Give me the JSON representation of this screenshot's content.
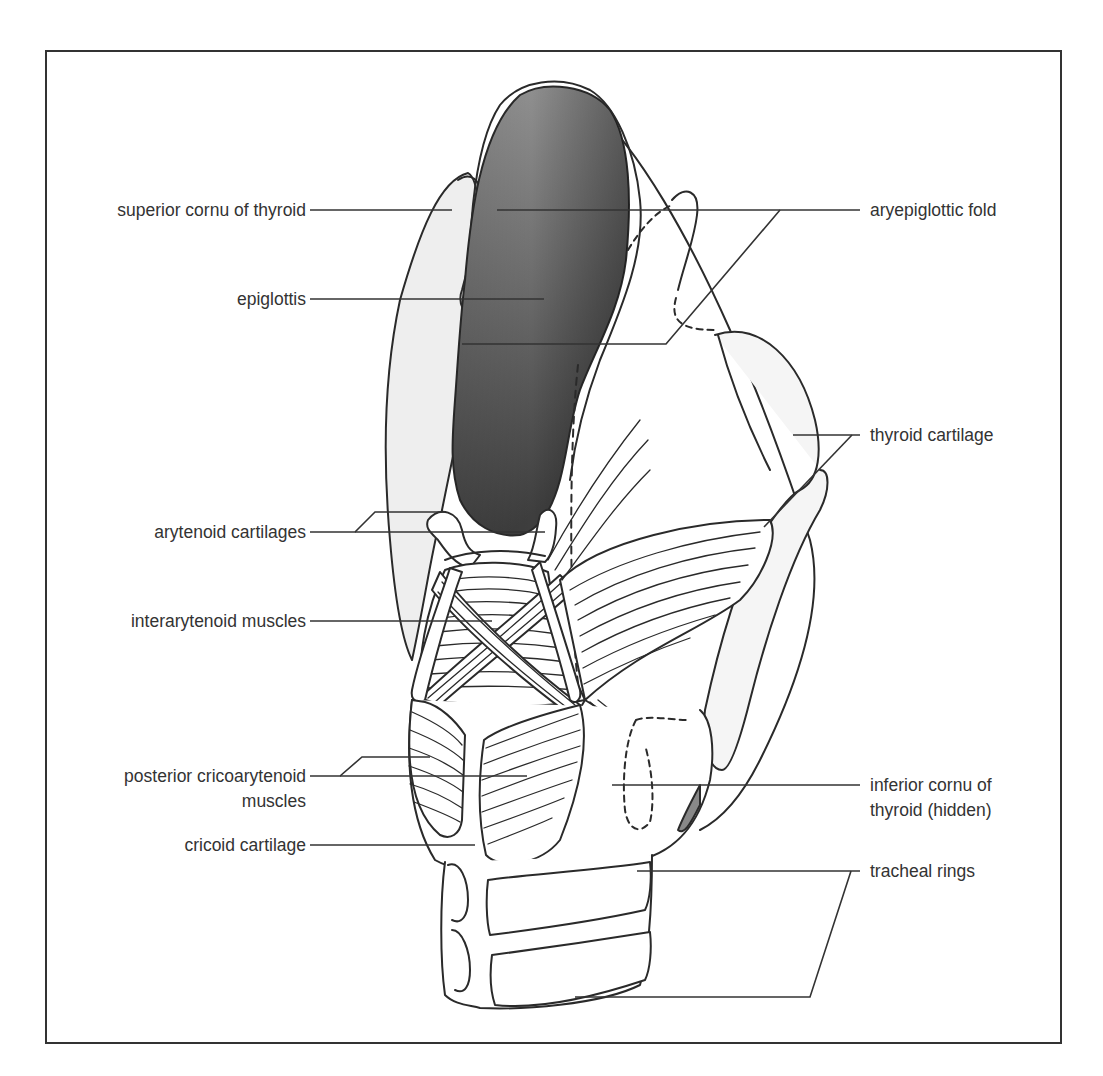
{
  "figure": {
    "type": "anatomical-illustration",
    "colors": {
      "frame": "#333333",
      "outline": "#2a2a2a",
      "label_text": "#333333",
      "epiglottis_dark": "#4a4a4a",
      "epiglottis_light": "#9a9a9a",
      "cartilage_stipple": "#e6e6e6"
    }
  },
  "labels": {
    "left": [
      {
        "id": "superior-cornu",
        "text": "superior cornu of thyroid"
      },
      {
        "id": "epiglottis",
        "text": "epiglottis"
      },
      {
        "id": "arytenoid-cartilages",
        "text": "arytenoid cartilages"
      },
      {
        "id": "interarytenoid-muscles",
        "text": "interarytenoid muscles"
      },
      {
        "id": "posterior-cricoarytenoid",
        "line1": "posterior cricoarytenoid",
        "line2": "muscles"
      },
      {
        "id": "cricoid-cartilage",
        "text": "cricoid cartilage"
      }
    ],
    "right": [
      {
        "id": "aryepiglottic-fold",
        "text": "aryepiglottic fold"
      },
      {
        "id": "thyroid-cartilage",
        "text": "thyroid cartilage"
      },
      {
        "id": "inferior-cornu",
        "line1": "inferior cornu of",
        "line2": "thyroid (hidden)"
      },
      {
        "id": "tracheal-rings",
        "text": "tracheal rings"
      }
    ]
  }
}
